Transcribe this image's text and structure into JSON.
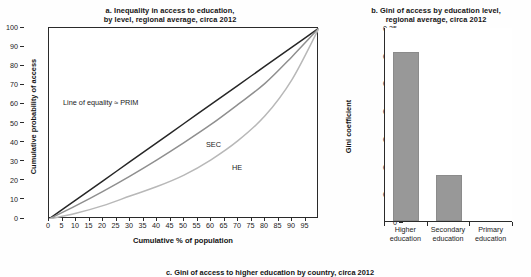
{
  "figure": {
    "bottom_cut_title": "c. Gini of access to higher education by country, circa 2012"
  },
  "panel_a": {
    "title": "a. Inequality in access to education,\nby level, regional average, circa 2012",
    "xlabel": "Cumulative % of population",
    "ylabel": "Cumulative probability of access",
    "annotations": {
      "equality": "Line of equality ≈ PRIM",
      "sec": "SEC",
      "he": "HE"
    }
  },
  "panel_b": {
    "title": "b. Gini of access by education level,\nregional average, circa 2012",
    "ylabel": "Gini coefficient"
  },
  "chart_data": [
    {
      "type": "line",
      "title": "a. Inequality in access to education, by level, regional average, circa 2012",
      "xlabel": "Cumulative % of population",
      "ylabel": "Cumulative probability of access",
      "xlim": [
        0,
        100
      ],
      "ylim": [
        0,
        100
      ],
      "xticks": [
        0,
        5,
        10,
        15,
        20,
        25,
        30,
        35,
        40,
        45,
        50,
        55,
        60,
        65,
        70,
        75,
        80,
        85,
        90,
        95
      ],
      "yticks": [
        0,
        10,
        20,
        30,
        40,
        50,
        60,
        70,
        80,
        90,
        100
      ],
      "grid": false,
      "legend": "inline-annotations",
      "x": [
        0,
        10,
        20,
        30,
        40,
        50,
        60,
        70,
        80,
        90,
        100
      ],
      "series": [
        {
          "name": "Line of equality ≈ PRIM",
          "color": "#262626",
          "values": [
            0,
            10,
            20,
            30,
            40,
            50,
            60,
            70,
            80,
            90,
            100
          ]
        },
        {
          "name": "SEC",
          "color": "#8f8f8f",
          "values": [
            0,
            7,
            14.5,
            22.5,
            31,
            40,
            49.5,
            60,
            71,
            85,
            100
          ]
        },
        {
          "name": "HE",
          "color": "#b8b8b8",
          "values": [
            0,
            3,
            7,
            12,
            17,
            23,
            31,
            41,
            54,
            73,
            100
          ]
        }
      ]
    },
    {
      "type": "bar",
      "title": "b. Gini of access by education level, regional average, circa 2012",
      "xlabel": "",
      "ylabel": "Gini coefficient",
      "ylim": [
        0,
        0.35
      ],
      "yticks": [
        0,
        0.05,
        0.1,
        0.15,
        0.2,
        0.25,
        0.3,
        0.35
      ],
      "ytick_labels": [
        "0",
        "0.05",
        "0.10",
        "0.15",
        "0.20",
        "0.25",
        "0.30",
        "0.35"
      ],
      "grid": false,
      "bar_color": "#989898",
      "categories": [
        "Higher\neducation",
        "Secondary\neducation",
        "Primary\neducation"
      ],
      "values": [
        0.305,
        0.083,
        0.0
      ]
    }
  ]
}
